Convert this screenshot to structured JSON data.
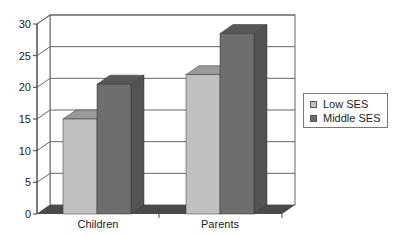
{
  "chart_data": {
    "type": "bar",
    "style": "3d-clustered-column",
    "title": "",
    "xlabel": "",
    "ylabel": "",
    "categories": [
      "Children",
      "Parents"
    ],
    "series": [
      {
        "name": "Low SES",
        "values": [
          15,
          22
        ],
        "color": "#c0c0c0"
      },
      {
        "name": "Middle SES",
        "values": [
          20.5,
          28.5
        ],
        "color": "#6e6e6e"
      }
    ],
    "ylim": [
      0,
      30
    ],
    "yticks": [
      "0",
      "5",
      "10",
      "15",
      "20",
      "25",
      "30"
    ],
    "grid": true,
    "legend_position": "right"
  },
  "legend": {
    "items": [
      {
        "label": "Low SES",
        "color": "#c0c0c0"
      },
      {
        "label": "Middle SES",
        "color": "#6e6e6e"
      }
    ]
  }
}
